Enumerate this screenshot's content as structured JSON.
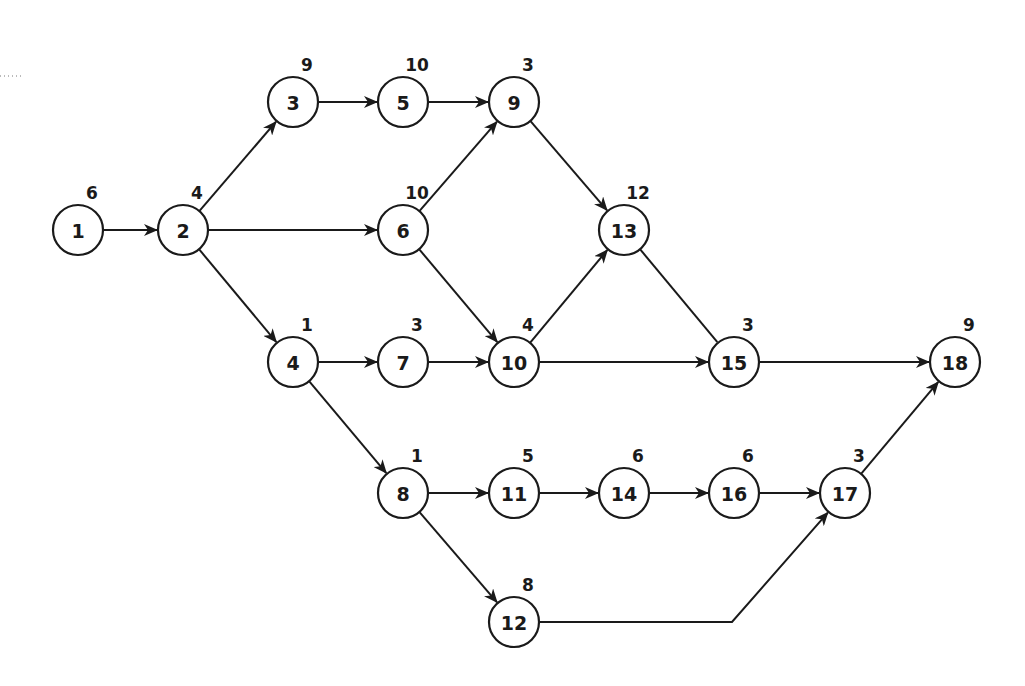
{
  "diagram": {
    "type": "activity-on-node network",
    "node_radius": 25,
    "colors": {
      "stroke": "#1a1a1a",
      "fill": "#ffffff",
      "background": "#ffffff"
    },
    "nodes": [
      {
        "id": "1",
        "label": "1",
        "duration": "6",
        "x": 78,
        "y": 230
      },
      {
        "id": "2",
        "label": "2",
        "duration": "4",
        "x": 183,
        "y": 230
      },
      {
        "id": "3",
        "label": "3",
        "duration": "9",
        "x": 293,
        "y": 102
      },
      {
        "id": "4",
        "label": "4",
        "duration": "1",
        "x": 293,
        "y": 362
      },
      {
        "id": "5",
        "label": "5",
        "duration": "10",
        "x": 403,
        "y": 102
      },
      {
        "id": "6",
        "label": "6",
        "duration": "10",
        "x": 403,
        "y": 230
      },
      {
        "id": "7",
        "label": "7",
        "duration": "3",
        "x": 403,
        "y": 362
      },
      {
        "id": "8",
        "label": "8",
        "duration": "1",
        "x": 403,
        "y": 493
      },
      {
        "id": "9",
        "label": "9",
        "duration": "3",
        "x": 514,
        "y": 102
      },
      {
        "id": "10",
        "label": "10",
        "duration": "4",
        "x": 514,
        "y": 362
      },
      {
        "id": "11",
        "label": "11",
        "duration": "5",
        "x": 514,
        "y": 493
      },
      {
        "id": "12",
        "label": "12",
        "duration": "8",
        "x": 514,
        "y": 622
      },
      {
        "id": "13",
        "label": "13",
        "duration": "12",
        "x": 624,
        "y": 230
      },
      {
        "id": "14",
        "label": "14",
        "duration": "6",
        "x": 624,
        "y": 493
      },
      {
        "id": "15",
        "label": "15",
        "duration": "3",
        "x": 734,
        "y": 362
      },
      {
        "id": "16",
        "label": "16",
        "duration": "6",
        "x": 734,
        "y": 493
      },
      {
        "id": "17",
        "label": "17",
        "duration": "3",
        "x": 845,
        "y": 493
      },
      {
        "id": "18",
        "label": "18",
        "duration": "9",
        "x": 955,
        "y": 362
      }
    ],
    "edges": [
      {
        "from": "1",
        "to": "2",
        "arrow": true
      },
      {
        "from": "2",
        "to": "3",
        "arrow": true
      },
      {
        "from": "2",
        "to": "6",
        "arrow": true
      },
      {
        "from": "2",
        "to": "4",
        "arrow": true
      },
      {
        "from": "3",
        "to": "5",
        "arrow": true
      },
      {
        "from": "5",
        "to": "9",
        "arrow": true
      },
      {
        "from": "6",
        "to": "9",
        "arrow": true
      },
      {
        "from": "6",
        "to": "10",
        "arrow": true
      },
      {
        "from": "4",
        "to": "7",
        "arrow": true
      },
      {
        "from": "4",
        "to": "8",
        "arrow": true
      },
      {
        "from": "7",
        "to": "10",
        "arrow": true
      },
      {
        "from": "9",
        "to": "13",
        "arrow": true
      },
      {
        "from": "10",
        "to": "13",
        "arrow": true
      },
      {
        "from": "10",
        "to": "15",
        "arrow": true
      },
      {
        "from": "13",
        "to": "15",
        "arrow": false
      },
      {
        "from": "15",
        "to": "18",
        "arrow": true
      },
      {
        "from": "8",
        "to": "11",
        "arrow": true
      },
      {
        "from": "8",
        "to": "12",
        "arrow": true
      },
      {
        "from": "11",
        "to": "14",
        "arrow": true
      },
      {
        "from": "14",
        "to": "16",
        "arrow": true
      },
      {
        "from": "16",
        "to": "17",
        "arrow": true
      },
      {
        "from": "12",
        "to": "17",
        "arrow": true,
        "via": [
          [
            732,
            622
          ]
        ]
      },
      {
        "from": "17",
        "to": "18",
        "arrow": true
      }
    ]
  }
}
